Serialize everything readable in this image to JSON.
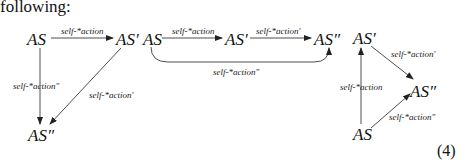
{
  "intro_text": "following:",
  "equation_number": "(4)",
  "diagram1": {
    "nodes": {
      "as": "AS",
      "as_prime": "AS′",
      "as_dprime": "AS″"
    },
    "edges": [
      {
        "from": "AS",
        "to": "AS′",
        "label": "self-*action"
      },
      {
        "from": "AS",
        "to": "AS″",
        "label": "self-*action″"
      },
      {
        "from": "AS′",
        "to": "AS″",
        "label": "self-*action′"
      }
    ]
  },
  "diagram2": {
    "nodes": {
      "as": "AS",
      "as_prime": "AS′",
      "as_dprime": "AS″"
    },
    "edges": [
      {
        "from": "AS",
        "to": "AS′",
        "label": "self-*action"
      },
      {
        "from": "AS′",
        "to": "AS″",
        "label": "self-*action′"
      },
      {
        "from": "AS",
        "to": "AS″",
        "label": "self-*action″",
        "style": "curved-below"
      }
    ]
  },
  "diagram3": {
    "nodes": {
      "as": "AS",
      "as_prime": "AS′",
      "as_dprime": "AS″"
    },
    "edges": [
      {
        "from": "AS",
        "to": "AS′",
        "label": "self-*action"
      },
      {
        "from": "AS′",
        "to": "AS″",
        "label": "self-*action′"
      },
      {
        "from": "AS",
        "to": "AS″",
        "label": "self-*action″"
      }
    ]
  }
}
